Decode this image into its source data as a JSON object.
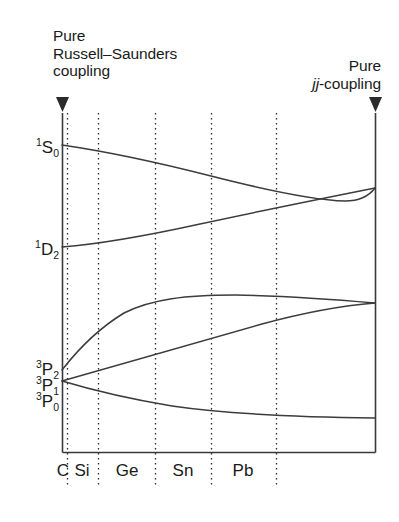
{
  "annotations": {
    "left": {
      "line1": "Pure",
      "line2": "Russell–Saunders",
      "line3": "coupling",
      "marker": "down-triangle-marker"
    },
    "right": {
      "line1": "Pure",
      "line2_italic": "jj",
      "line2_rest": "-coupling",
      "marker": "down-triangle-marker"
    }
  },
  "term_symbols": [
    {
      "id": "1S0",
      "pre": "1",
      "letter": "S",
      "post": "0",
      "y": 145
    },
    {
      "id": "1D2",
      "pre": "1",
      "letter": "D",
      "post": "2",
      "y": 247
    },
    {
      "id": "3P2",
      "pre": "3",
      "letter": "P",
      "post": "2",
      "y": 370
    },
    {
      "id": "3P1",
      "pre": "3",
      "letter": "P",
      "post": "1",
      "y": 381
    },
    {
      "id": "3P0",
      "pre": "3",
      "letter": "P",
      "post": "0",
      "y": 399
    }
  ],
  "axis": {
    "element_labels": [
      "C",
      "Si",
      "Ge",
      "Sn",
      "Pb"
    ],
    "element_label_x": [
      63,
      82,
      127,
      183,
      243
    ],
    "gridline_x": [
      67,
      98,
      155,
      211,
      276
    ]
  },
  "chart_data": {
    "type": "line",
    "xlabel": "",
    "ylabel": "Energy",
    "grid": true,
    "legend": "none",
    "x_category_labels": [
      "C",
      "Si",
      "Ge",
      "Sn",
      "Pb"
    ],
    "xlim": [
      0,
      1
    ],
    "ylim_note": "Energy increases upward; axis unlabelled and unscaled",
    "left_limit_label": "Pure Russell–Saunders coupling",
    "right_limit_label": "Pure jj-coupling",
    "series": [
      {
        "name": "1S0",
        "start_label": "¹S₀",
        "points": [
          [
            62,
            145
          ],
          [
            98,
            150
          ],
          [
            135,
            156
          ],
          [
            172,
            165
          ],
          [
            211,
            176
          ],
          [
            250,
            186
          ],
          [
            290,
            196
          ],
          [
            330,
            203
          ],
          [
            375,
            188
          ]
        ],
        "note": "descends gently then merges with 1D2 at right limit"
      },
      {
        "name": "1D2",
        "start_label": "¹D₂",
        "points": [
          [
            62,
            247
          ],
          [
            98,
            243
          ],
          [
            135,
            237
          ],
          [
            172,
            229
          ],
          [
            211,
            220
          ],
          [
            250,
            211
          ],
          [
            290,
            203
          ],
          [
            330,
            196
          ],
          [
            375,
            188
          ]
        ],
        "note": "rises steadily, converging with 1S0 at right limit"
      },
      {
        "name": "3P2",
        "start_label": "³P₂",
        "points": [
          [
            62,
            370
          ],
          [
            84,
            345
          ],
          [
            106,
            325
          ],
          [
            130,
            310
          ],
          [
            160,
            300
          ],
          [
            196,
            296
          ],
          [
            240,
            295
          ],
          [
            290,
            297
          ],
          [
            330,
            300
          ],
          [
            375,
            303
          ]
        ],
        "note": "rises steeply then flattens to a broad maximum, converging with 3P1"
      },
      {
        "name": "3P1",
        "start_label": "³P₁",
        "points": [
          [
            62,
            381
          ],
          [
            110,
            368
          ],
          [
            160,
            353
          ],
          [
            211,
            339
          ],
          [
            260,
            325
          ],
          [
            310,
            313
          ],
          [
            375,
            303
          ]
        ],
        "note": "rises nearly linearly to meet 3P2 at right limit"
      },
      {
        "name": "3P0",
        "start_label": "³P₀",
        "points": [
          [
            62,
            381
          ],
          [
            98,
            390
          ],
          [
            135,
            398
          ],
          [
            172,
            405
          ],
          [
            211,
            410
          ],
          [
            250,
            414
          ],
          [
            290,
            416
          ],
          [
            330,
            417
          ],
          [
            375,
            418
          ]
        ],
        "note": "descends and levels off asymptotically"
      }
    ]
  }
}
